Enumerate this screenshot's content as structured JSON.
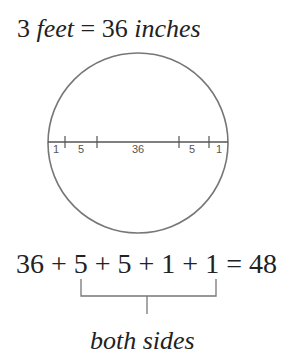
{
  "title": {
    "quantity": "3",
    "unit_left": "feet",
    "equals": "=",
    "value": "36",
    "unit_right": "inches"
  },
  "diagram": {
    "shape": "circle",
    "diameter_segments": [
      {
        "label": "1"
      },
      {
        "label": "5"
      },
      {
        "label": "36"
      },
      {
        "label": "5"
      },
      {
        "label": "1"
      }
    ],
    "stroke_color": "#777777"
  },
  "equation": {
    "text": "36 + 5 + 5 + 1 + 1 = 48"
  },
  "brace_label": "both sides"
}
